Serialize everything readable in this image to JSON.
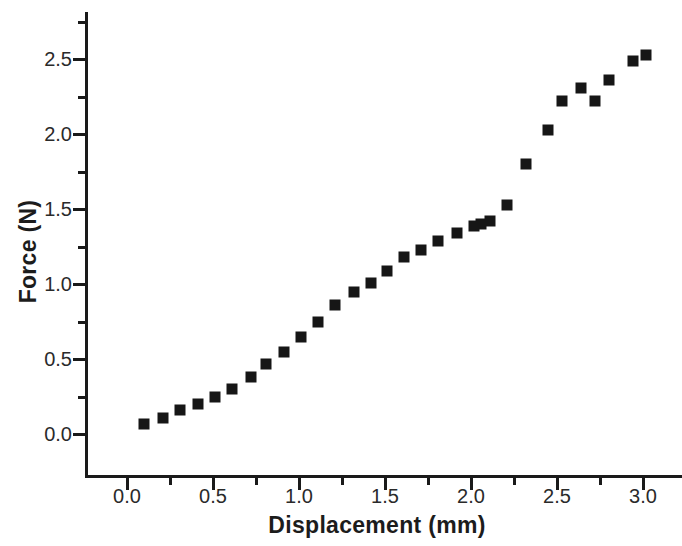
{
  "chart_data": {
    "type": "scatter",
    "title": "",
    "xlabel": "Displacement (mm)",
    "ylabel": "Force (N)",
    "xlim": [
      -0.22,
      3.22
    ],
    "ylim": [
      -0.28,
      2.78
    ],
    "grid": false,
    "legend": null,
    "marker_style": "filled-square",
    "marker_color": "#161616",
    "axis_color": "#1a1a1a",
    "background_color": "#ffffff",
    "xticks": [
      "0.0",
      "0.5",
      "1.0",
      "1.5",
      "2.0",
      "2.5",
      "3.0"
    ],
    "xtick_values": [
      0.0,
      0.5,
      1.0,
      1.5,
      2.0,
      2.5,
      3.0
    ],
    "xminor_step": 0.25,
    "yticks": [
      "0.0",
      "0.5",
      "1.0",
      "1.5",
      "2.0",
      "2.5"
    ],
    "ytick_values": [
      0.0,
      0.5,
      1.0,
      1.5,
      2.0,
      2.5
    ],
    "yminor_step": 0.25,
    "series": [
      {
        "name": "Force vs Displacement",
        "x": [
          0.1,
          0.21,
          0.31,
          0.41,
          0.51,
          0.61,
          0.72,
          0.81,
          0.91,
          1.01,
          1.11,
          1.21,
          1.32,
          1.42,
          1.51,
          1.61,
          1.71,
          1.81,
          1.92,
          2.02,
          2.06,
          2.11,
          2.21,
          2.32,
          2.45,
          2.53,
          2.64,
          2.72,
          2.8,
          2.94,
          3.02
        ],
        "y": [
          0.07,
          0.11,
          0.16,
          0.2,
          0.25,
          0.3,
          0.38,
          0.47,
          0.55,
          0.65,
          0.75,
          0.86,
          0.95,
          1.01,
          1.09,
          1.18,
          1.23,
          1.29,
          1.34,
          1.39,
          1.4,
          1.42,
          1.53,
          1.8,
          2.03,
          2.22,
          2.31,
          2.22,
          2.36,
          2.49,
          2.53
        ]
      }
    ]
  }
}
